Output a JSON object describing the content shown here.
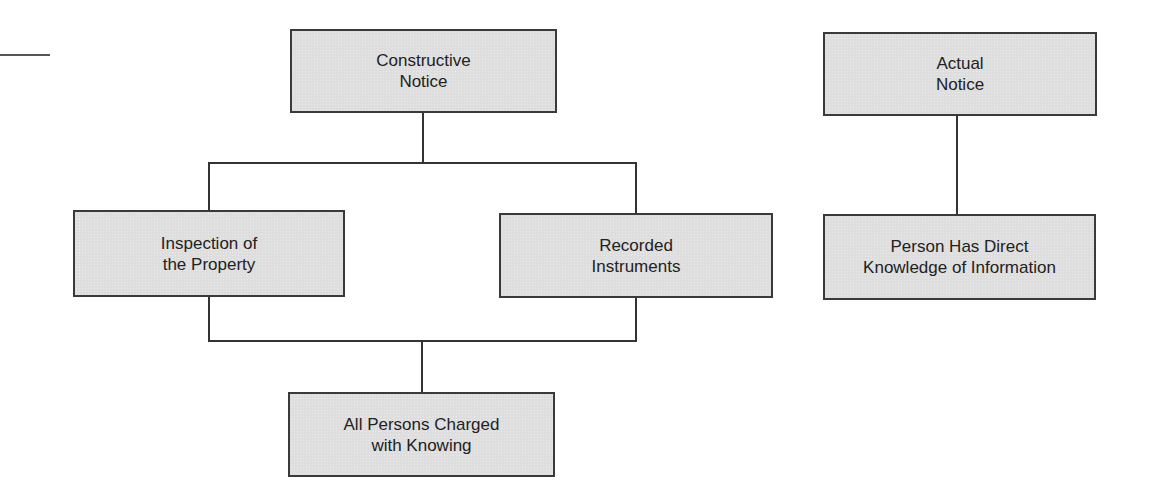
{
  "diagram": {
    "nodes": {
      "constructive_notice": {
        "label": "Constructive\nNotice"
      },
      "inspection": {
        "label": "Inspection of\nthe Property"
      },
      "recorded": {
        "label": "Recorded\nInstruments"
      },
      "all_persons": {
        "label": "All Persons Charged\nwith Knowing"
      },
      "actual_notice": {
        "label": "Actual\nNotice"
      },
      "direct_knowledge": {
        "label": "Person Has Direct\nKnowledge of Information"
      }
    },
    "edges": [
      {
        "from": "constructive_notice",
        "to": "inspection"
      },
      {
        "from": "constructive_notice",
        "to": "recorded"
      },
      {
        "from": "inspection",
        "to": "all_persons"
      },
      {
        "from": "recorded",
        "to": "all_persons"
      },
      {
        "from": "actual_notice",
        "to": "direct_knowledge"
      }
    ],
    "colors": {
      "box_fill": "#dedede",
      "border": "#3a3a3a",
      "text": "#222222"
    }
  }
}
